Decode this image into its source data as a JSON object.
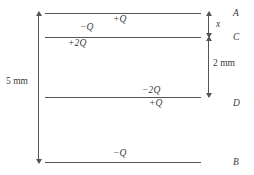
{
  "figure": {
    "line_color": "#555555",
    "text_color": "#3a3a3a",
    "background": "#ffffff",
    "plates": [
      {
        "id": "A",
        "label": "A",
        "y": 13,
        "x_start": 45,
        "x_end": 201,
        "label_x": 233,
        "label_y": 8
      },
      {
        "id": "C",
        "label": "C",
        "y": 37,
        "x_start": 45,
        "x_end": 201,
        "label_x": 233,
        "label_y": 32
      },
      {
        "id": "D",
        "label": "D",
        "y": 97,
        "x_start": 45,
        "x_end": 201,
        "label_x": 233,
        "label_y": 98
      },
      {
        "id": "B",
        "label": "B",
        "y": 162,
        "x_start": 45,
        "x_end": 201,
        "label_x": 233,
        "label_y": 157
      }
    ],
    "charges": [
      {
        "name": "plate-a-bottom-charge",
        "text": "+Q",
        "x": 113,
        "y": 14
      },
      {
        "name": "plate-c-top-charge",
        "text": "−Q",
        "x": 80,
        "y": 22
      },
      {
        "name": "plate-c-bottom-charge",
        "text": "+2Q",
        "x": 68,
        "y": 38
      },
      {
        "name": "plate-d-top-charge",
        "text": "−2Q",
        "x": 142,
        "y": 85
      },
      {
        "name": "plate-d-bottom-charge",
        "text": "+Q",
        "x": 149,
        "y": 98
      },
      {
        "name": "plate-b-top-charge",
        "text": "−Q",
        "x": 113,
        "y": 148
      }
    ],
    "dimensions": [
      {
        "name": "overall-height-dimension",
        "label": "5 mm",
        "value": 5,
        "unit": "mm",
        "line_x": 38,
        "y_top": 13,
        "y_bottom": 162,
        "label_x": 6,
        "label_y": 81
      },
      {
        "name": "gap-x-dimension",
        "label": "x",
        "line_x": 208,
        "y_top": 13,
        "y_bottom": 37,
        "label_x": 216,
        "label_y": 18,
        "italic": true
      },
      {
        "name": "gap-2mm-dimension",
        "label": "2 mm",
        "value": 2,
        "unit": "mm",
        "line_x": 208,
        "y_top": 37,
        "y_bottom": 97,
        "label_x": 213,
        "label_y": 60
      }
    ]
  }
}
